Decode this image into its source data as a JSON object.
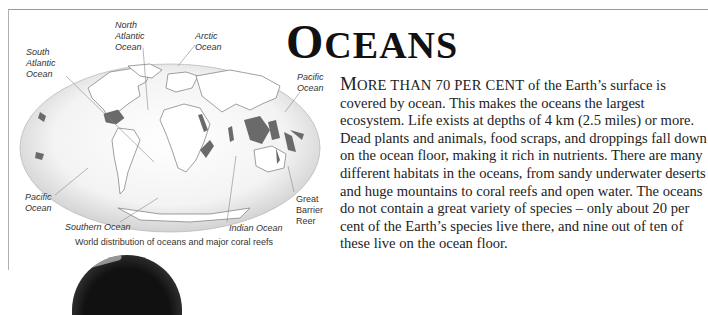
{
  "page": {
    "title_first_letter": "O",
    "title_rest": "CEANS"
  },
  "map": {
    "caption": "World distribution of oceans and major coral reefs",
    "labels": {
      "north_atlantic": [
        "North",
        "Atlantic",
        "Ocean"
      ],
      "arctic": [
        "Arctic",
        "Ocean"
      ],
      "south_atlantic": [
        "South",
        "Atlantic",
        "Ocean"
      ],
      "pacific_right": [
        "Pacific",
        "Ocean"
      ],
      "pacific_left": [
        "Pacific",
        "Ocean"
      ],
      "southern": "Southern Ocean",
      "indian": "Indian Ocean",
      "great_barrier": [
        "Great",
        "Barrier",
        "Reer"
      ]
    },
    "colors": {
      "ocean": "#eeeeee",
      "land_outline": "#666666",
      "reef": "#6a6a6a"
    }
  },
  "body": {
    "lead_first_letter": "M",
    "lead_rest": "ORE THAN 70 PER CENT",
    "text": " of the Earth’s surface is covered by ocean. This makes the oceans the largest ecosystem. Life exists at depths of 4 km (2.5 miles) or more. Dead plants and animals, food scraps, and droppings fall down on the ocean floor, making it rich in nutrients. There are many different habitats in the oceans, from sandy underwater deserts and huge mountains to coral reefs and open water. The oceans do not contain a great variety of species – only about 20 per cent of the Earth’s species live there, and nine out of ten of these live on the ocean floor."
  }
}
